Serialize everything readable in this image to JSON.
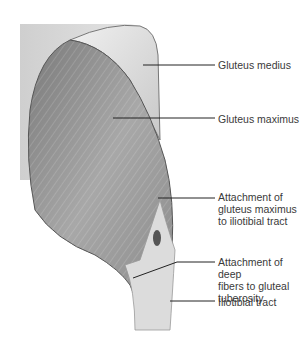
{
  "figure": {
    "labels": [
      {
        "id": "gluteus-medius",
        "text": "Gluteus medius",
        "x": 218,
        "y": 59
      },
      {
        "id": "gluteus-maximus",
        "text": "Gluteus maximus",
        "x": 218,
        "y": 113
      },
      {
        "id": "attachment-itt",
        "text": "Attachment of\ngluteus maximus\nto iliotibial tract",
        "x": 218,
        "y": 191
      },
      {
        "id": "attachment-deep",
        "text": "Attachment of deep\nfibers to gluteal\ntuberosity",
        "x": 218,
        "y": 257
      },
      {
        "id": "iliotibial-tract",
        "text": "Iliotibial tract",
        "x": 218,
        "y": 296
      }
    ],
    "colors": {
      "background": "#ffffff",
      "muscle_dark": "#6e6e6e",
      "muscle_mid": "#9a9a9a",
      "muscle_light": "#d9d9d9",
      "leader_line": "#222222",
      "label_text": "#3a3a3a"
    }
  }
}
